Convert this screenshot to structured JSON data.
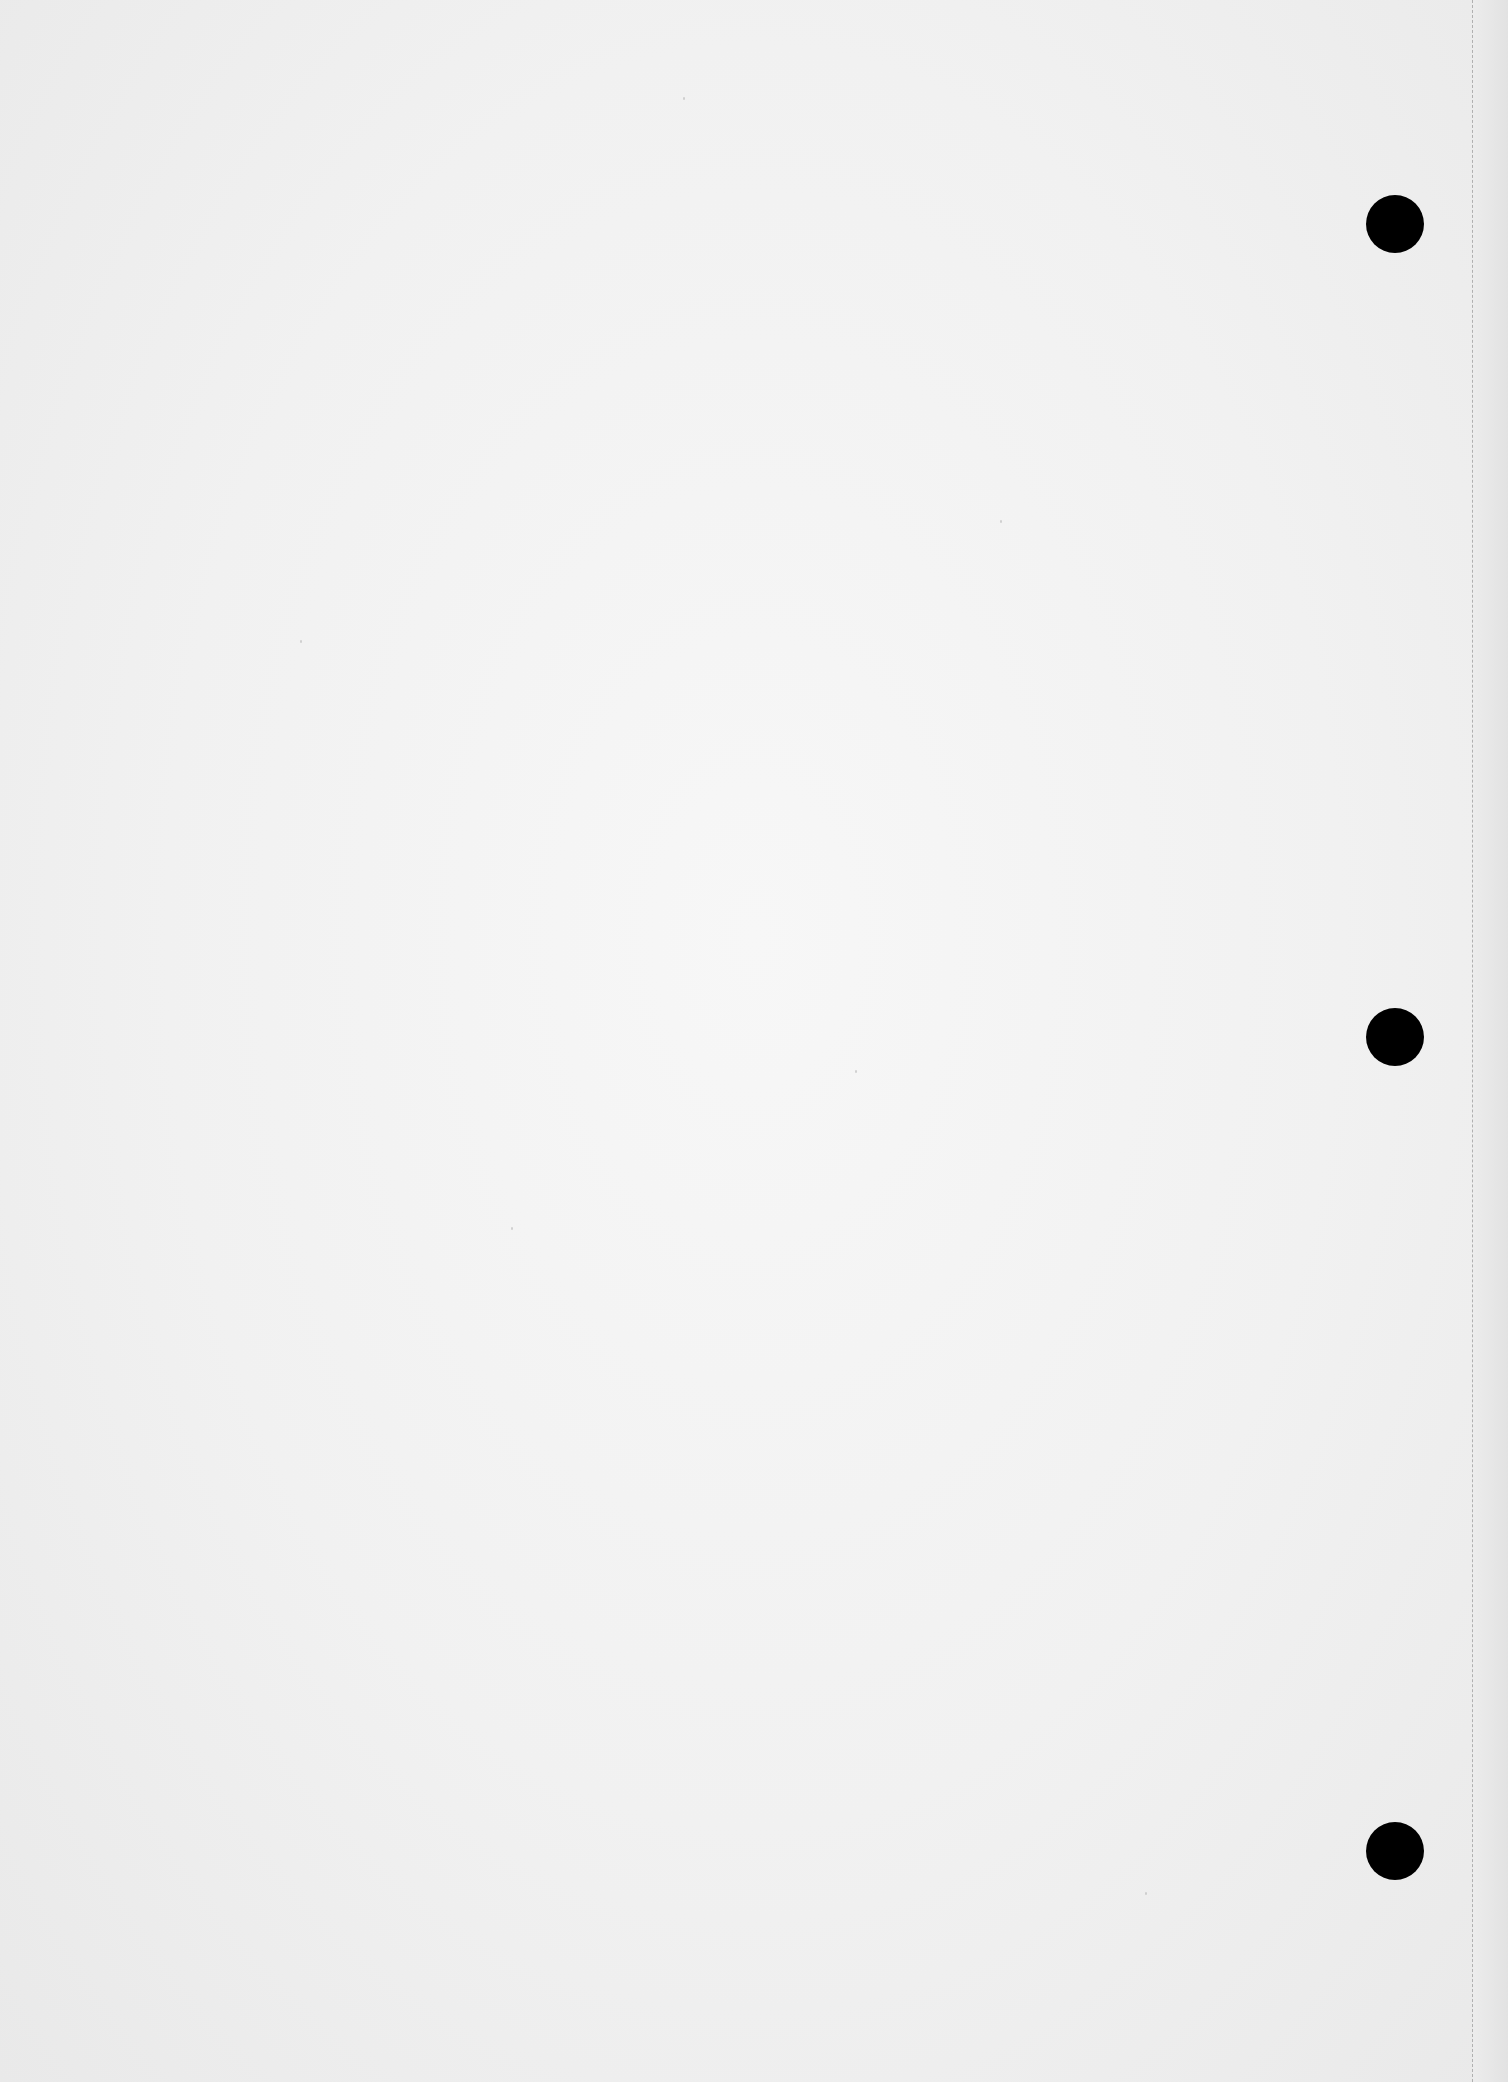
{
  "page": {
    "type": "blank scanned sheet",
    "background_color": "#f2f2f2",
    "text": ""
  },
  "punch_holes": [
    {
      "x": 1395,
      "y": 224,
      "diameter": 58,
      "color": "#000000"
    },
    {
      "x": 1395,
      "y": 1037,
      "diameter": 58,
      "color": "#000000"
    },
    {
      "x": 1395,
      "y": 1851,
      "diameter": 58,
      "color": "#000000"
    }
  ],
  "perforation": {
    "x": 1472,
    "style": "dashed",
    "color": "#b0b0b0"
  }
}
